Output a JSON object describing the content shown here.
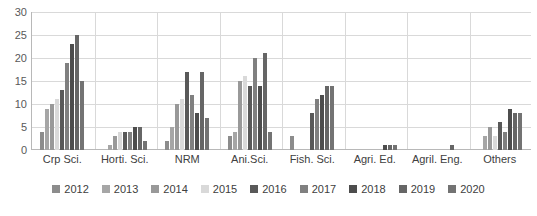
{
  "chart_data": {
    "type": "bar",
    "title": "",
    "subtitle": "",
    "xlabel": "",
    "ylabel": "",
    "ylim": [
      0,
      30
    ],
    "ytick_labels": [
      "0",
      "5",
      "10",
      "15",
      "20",
      "25",
      "30"
    ],
    "ytick_values": [
      0,
      5,
      10,
      15,
      20,
      25,
      30
    ],
    "grid": true,
    "legend_position": "bottom",
    "categories": [
      "Crp Sci.",
      "Horti. Sci.",
      "NRM",
      "Ani.Sci.",
      "Fish. Sci.",
      "Agri. Ed.",
      "Agril. Eng.",
      "Others"
    ],
    "series": [
      {
        "name": "2012",
        "color": "#8c8c8c",
        "values": [
          4,
          0,
          2,
          3,
          3,
          0,
          0,
          0
        ]
      },
      {
        "name": "2013",
        "color": "#a6a6a6",
        "values": [
          9,
          1,
          5,
          4,
          0,
          0,
          0,
          3
        ]
      },
      {
        "name": "2014",
        "color": "#999999",
        "values": [
          10,
          3,
          10,
          15,
          0,
          0,
          0,
          5
        ]
      },
      {
        "name": "2015",
        "color": "#d9d9d9",
        "values": [
          11,
          4,
          11,
          16,
          0,
          0,
          0,
          3
        ]
      },
      {
        "name": "2016",
        "color": "#595959",
        "values": [
          13,
          4,
          17,
          14,
          8,
          0,
          0,
          6
        ]
      },
      {
        "name": "2017",
        "color": "#808080",
        "values": [
          19,
          4,
          12,
          20,
          11,
          0,
          0,
          4
        ]
      },
      {
        "name": "2018",
        "color": "#4d4d4d",
        "values": [
          23,
          5,
          8,
          14,
          12,
          1,
          0,
          9
        ]
      },
      {
        "name": "2019",
        "color": "#666666",
        "values": [
          25,
          5,
          17,
          21,
          14,
          1,
          1,
          8
        ]
      },
      {
        "name": "2020",
        "color": "#737373",
        "values": [
          15,
          2,
          7,
          4,
          14,
          1,
          0,
          8
        ]
      }
    ]
  },
  "axis": {
    "y_label_color": "#595959",
    "x_label_color": "#404040",
    "gridline_color": "#d9d9d9",
    "axis_line_color": "#b8b8b8"
  }
}
